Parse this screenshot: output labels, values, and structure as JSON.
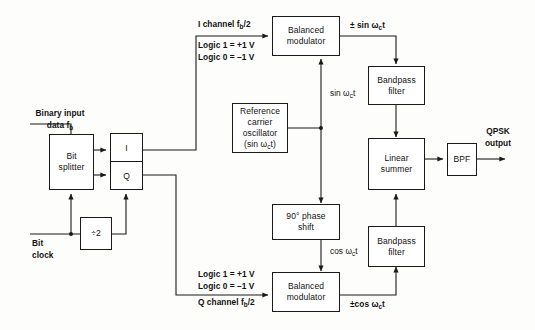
{
  "diagram": {
    "line_color": "#1a1a1a"
  },
  "blocks": {
    "bit_splitter": {
      "line1": "Bit",
      "line2": "splitter"
    },
    "i_channel_reg": {
      "label": "I"
    },
    "q_channel_reg": {
      "label": "Q"
    },
    "divider": {
      "label": "÷2"
    },
    "balanced_modulator_top": {
      "line1": "Balanced",
      "line2": "modulator"
    },
    "balanced_modulator_bottom": {
      "line1": "Balanced",
      "line2": "modulator"
    },
    "reference_oscillator": {
      "line1": "Reference",
      "line2": "carrier",
      "line3": "oscillator",
      "line4": "(sin ω",
      "line4_sub": "c",
      "line4_end": "t)"
    },
    "phase_shift": {
      "line1": "90° phase",
      "line2": "shift"
    },
    "bandpass_filter_top": {
      "line1": "Bandpass",
      "line2": "filter"
    },
    "bandpass_filter_bottom": {
      "line1": "Bandpass",
      "line2": "filter"
    },
    "linear_summer": {
      "line1": "Linear",
      "line2": "summer"
    },
    "bpf": {
      "label": "BPF"
    }
  },
  "labels": {
    "binary_input_l1": "Binary input",
    "binary_input_l2": "data f",
    "binary_input_sub": "b",
    "bit_clock_l1": "Bit",
    "bit_clock_l2": "clock",
    "i_channel_title": "I channel f",
    "i_channel_title_sub": "b",
    "i_channel_title_end": "/2",
    "i_logic1": "Logic 1 = +1 V",
    "i_logic0": "Logic 0 = –1 V",
    "q_logic1": "Logic 1 = +1 V",
    "q_logic0": "Logic 0 = –1 V",
    "q_channel_title": "Q channel f",
    "q_channel_title_sub": "b",
    "q_channel_title_end": "/2",
    "sin_carrier": "sin ω",
    "sin_carrier_sub": "c",
    "sin_carrier_end": "t",
    "cos_carrier": "cos ω",
    "cos_carrier_sub": "c",
    "cos_carrier_end": "t",
    "sin_out": "± sin ω",
    "sin_out_sub": "c",
    "sin_out_end": "t",
    "cos_out": "±cos ω",
    "cos_out_sub": "c",
    "cos_out_end": "t",
    "qpsk_out_l1": "QPSK",
    "qpsk_out_l2": "output"
  }
}
